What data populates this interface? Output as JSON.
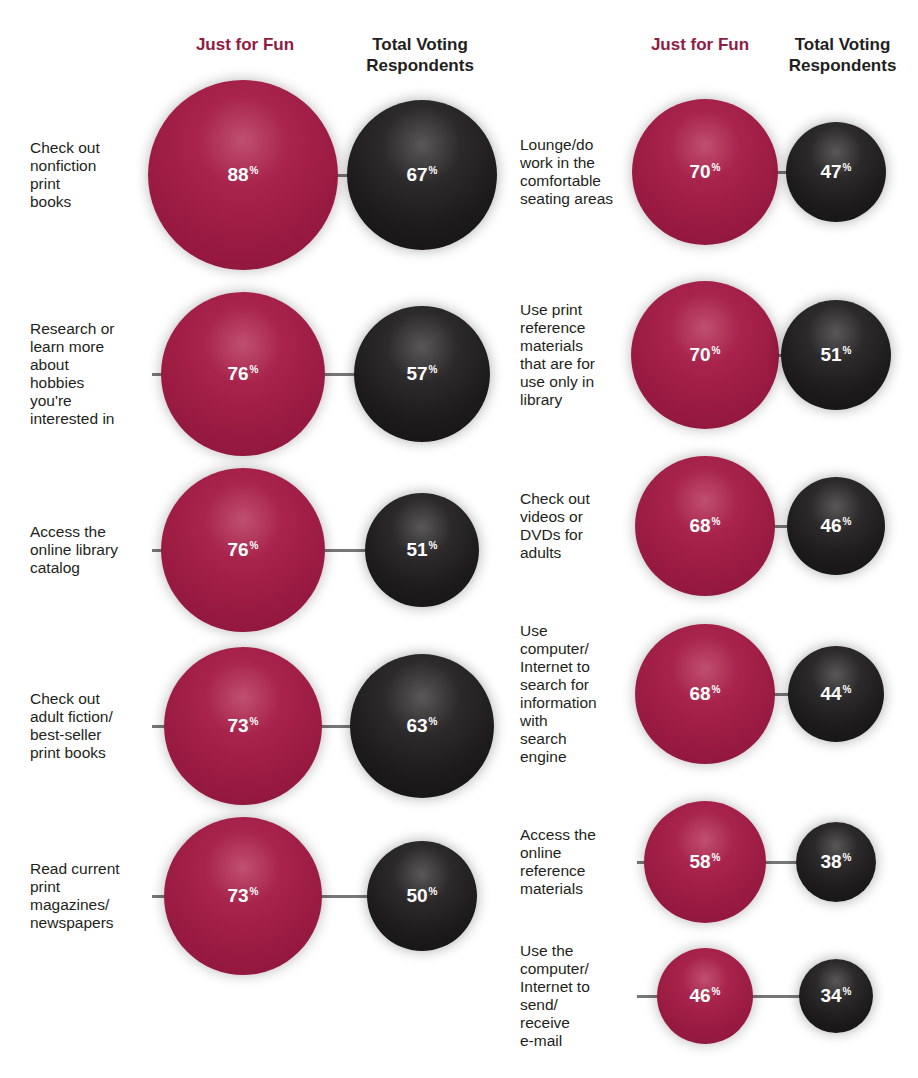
{
  "headers": {
    "left_fun": "Just for Fun",
    "left_total": "Total Voting Respondents",
    "right_fun": "Just for Fun",
    "right_total": "Total Voting Respondents"
  },
  "colors": {
    "just_for_fun": "#9b1b43",
    "total_voting": "#1c1a1b",
    "connector": "#777777"
  },
  "chart_data": {
    "type": "bubble",
    "title": "",
    "series": [
      {
        "name": "Just for Fun",
        "color": "#9b1b43"
      },
      {
        "name": "Total Voting Respondents",
        "color": "#1c1a1b"
      }
    ],
    "unit": "%",
    "columns": [
      {
        "items": [
          {
            "label": "Check out\nnonfiction\nprint\nbooks",
            "just_for_fun": 88,
            "total_voting": 67
          },
          {
            "label": "Research or\nlearn more\nabout\nhobbies\nyou're\ninterested in",
            "just_for_fun": 76,
            "total_voting": 57
          },
          {
            "label": "Access the\nonline library\ncatalog",
            "just_for_fun": 76,
            "total_voting": 51
          },
          {
            "label": "Check out\nadult fiction/\nbest-seller\nprint books",
            "just_for_fun": 73,
            "total_voting": 63
          },
          {
            "label": "Read current\nprint\nmagazines/\nnewspapers",
            "just_for_fun": 73,
            "total_voting": 50
          }
        ]
      },
      {
        "items": [
          {
            "label": "Lounge/do\nwork in the\ncomfortable\nseating areas",
            "just_for_fun": 70,
            "total_voting": 47
          },
          {
            "label": "Use print\nreference\nmaterials\nthat are for\nuse only in\nlibrary",
            "just_for_fun": 70,
            "total_voting": 51
          },
          {
            "label": "Check out\nvideos or\nDVDs for\nadults",
            "just_for_fun": 68,
            "total_voting": 46
          },
          {
            "label": "Use\ncomputer/\nInternet to\nsearch for\ninformation\nwith\nsearch\nengine",
            "just_for_fun": 68,
            "total_voting": 44
          },
          {
            "label": "Access the\nonline\nreference\nmaterials",
            "just_for_fun": 58,
            "total_voting": 38
          },
          {
            "label": "Use the\ncomputer/\nInternet to\nsend/\nreceive\ne-mail",
            "just_for_fun": 46,
            "total_voting": 34
          }
        ]
      }
    ],
    "display": {
      "left": [
        {
          "fun": "88",
          "total": "67",
          "pct": "%"
        },
        {
          "fun": "76",
          "total": "57",
          "pct": "%"
        },
        {
          "fun": "76",
          "total": "51",
          "pct": "%"
        },
        {
          "fun": "73",
          "total": "63",
          "pct": "%"
        },
        {
          "fun": "73",
          "total": "50",
          "pct": "%"
        }
      ],
      "right": [
        {
          "fun": "70",
          "total": "47",
          "pct": "%"
        },
        {
          "fun": "70",
          "total": "51",
          "pct": "%"
        },
        {
          "fun": "68",
          "total": "46",
          "pct": "%"
        },
        {
          "fun": "68",
          "total": "44",
          "pct": "%"
        },
        {
          "fun": "58",
          "total": "38",
          "pct": "%"
        },
        {
          "fun": "46",
          "total": "34",
          "pct": "%"
        }
      ]
    }
  }
}
